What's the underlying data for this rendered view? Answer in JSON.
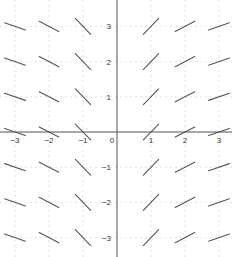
{
  "chart_data": {
    "type": "slope_field",
    "title": "",
    "xlabel": "",
    "ylabel": "",
    "xlim": [
      -3.4,
      3.4
    ],
    "ylim": [
      -3.4,
      3.6
    ],
    "grid": true,
    "x_ticks": [
      -3,
      -2,
      -1,
      0,
      1,
      2,
      3
    ],
    "y_ticks": [
      -3,
      -2,
      -1,
      1,
      2,
      3
    ],
    "x_tick_labels": [
      "−3",
      "−2",
      "−1",
      "0",
      "1",
      "2",
      "3"
    ],
    "y_tick_labels": [
      "−3",
      "−2",
      "−1",
      "1",
      "2",
      "3"
    ],
    "sample_x": [
      -3,
      -2,
      -1,
      1,
      2,
      3
    ],
    "sample_y": [
      -3,
      -2,
      -1,
      0,
      1,
      2,
      3
    ],
    "slope_rule": "dy/dx = 1/x",
    "slopes_by_x": {
      "-3": -0.333,
      "-2": -0.5,
      "-1": -1,
      "1": 1,
      "2": 0.5,
      "3": 0.333
    },
    "colors": {
      "axis": "#555555",
      "grid": "#d8d8d8",
      "segment": "#555555"
    }
  }
}
